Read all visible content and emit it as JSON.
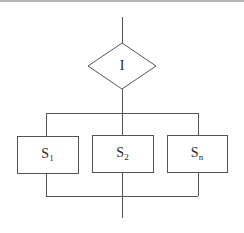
{
  "diagram": {
    "type": "flowchart",
    "title": "",
    "structure": "multi-branch selection (switch/case)",
    "decision": {
      "label": "I",
      "shape": "diamond"
    },
    "branches": [
      {
        "label": "S",
        "subscript": "1"
      },
      {
        "label": "S",
        "subscript": "2"
      },
      {
        "label": "S",
        "subscript": "n"
      }
    ],
    "colors": {
      "line": "#555555",
      "text": "#2a2a2a",
      "background": "#ffffff"
    }
  }
}
